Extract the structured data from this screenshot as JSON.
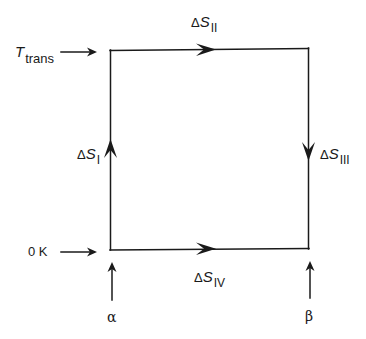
{
  "diagram": {
    "type": "thermodynamic-cycle",
    "line_color": "#1a1a1a",
    "background": "#ffffff",
    "box": {
      "left": 110,
      "top": 49,
      "right": 309,
      "bottom": 250
    },
    "left_markers": {
      "top": {
        "symbol": "T",
        "subscript": "trans"
      },
      "bottom": {
        "text": "0 K"
      }
    },
    "bottom_markers": {
      "left": {
        "text": "α"
      },
      "right": {
        "text": "β"
      }
    },
    "edges": [
      {
        "id": "I",
        "side": "left",
        "direction": "up",
        "label": {
          "delta": "Δ",
          "symbol": "S",
          "subscript": "I"
        }
      },
      {
        "id": "II",
        "side": "top",
        "direction": "right",
        "label": {
          "delta": "Δ",
          "symbol": "S",
          "subscript": "II"
        }
      },
      {
        "id": "III",
        "side": "right",
        "direction": "down",
        "label": {
          "delta": "Δ",
          "symbol": "S",
          "subscript": "III"
        }
      },
      {
        "id": "IV",
        "side": "bottom",
        "direction": "right",
        "label": {
          "delta": "Δ",
          "symbol": "S",
          "subscript": "IV"
        }
      }
    ]
  }
}
